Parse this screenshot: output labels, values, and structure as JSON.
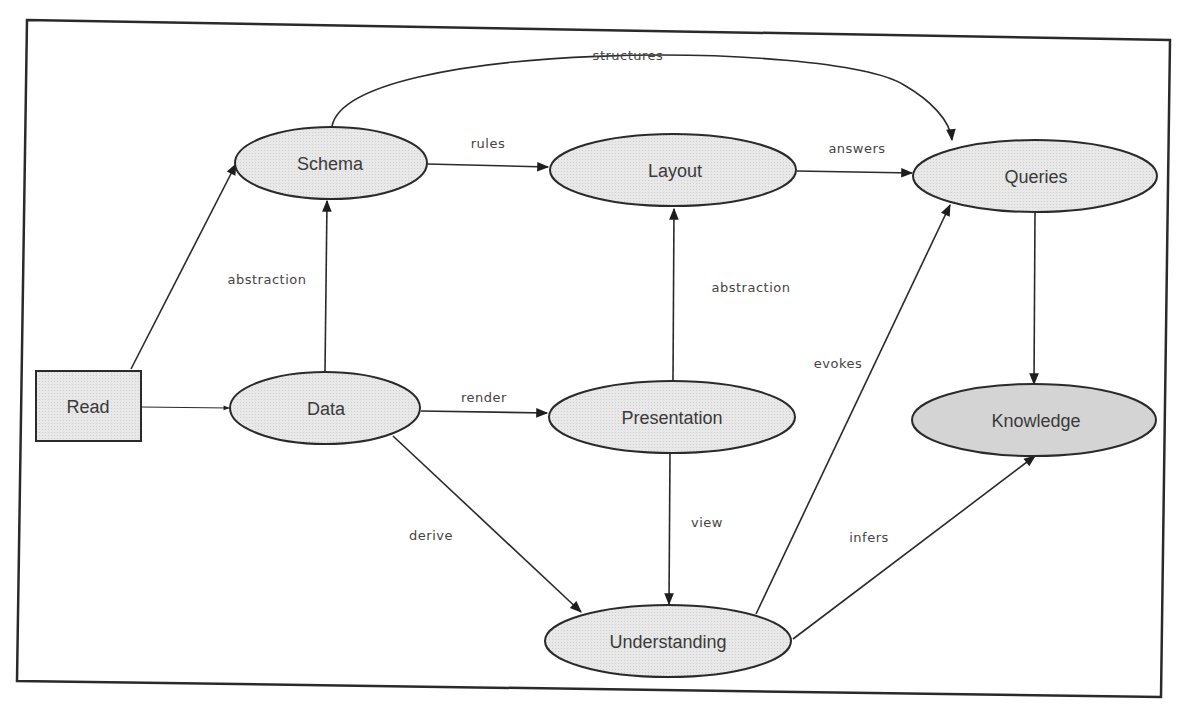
{
  "diagram": {
    "type": "flow-graph",
    "nodes": {
      "read": {
        "label": "Read",
        "shape": "rectangle"
      },
      "schema": {
        "label": "Schema",
        "shape": "ellipse"
      },
      "data": {
        "label": "Data",
        "shape": "ellipse"
      },
      "layout": {
        "label": "Layout",
        "shape": "ellipse"
      },
      "presentation": {
        "label": "Presentation",
        "shape": "ellipse"
      },
      "understanding": {
        "label": "Understanding",
        "shape": "ellipse"
      },
      "queries": {
        "label": "Queries",
        "shape": "ellipse"
      },
      "knowledge": {
        "label": "Knowledge",
        "shape": "ellipse"
      }
    },
    "edges": {
      "read_schema": {
        "from": "Read",
        "to": "Schema",
        "label": ""
      },
      "read_data": {
        "from": "Read",
        "to": "Data",
        "label": ""
      },
      "data_schema": {
        "from": "Data",
        "to": "Schema",
        "label": "abstraction"
      },
      "schema_layout": {
        "from": "Schema",
        "to": "Layout",
        "label": "rules"
      },
      "schema_queries": {
        "from": "Schema",
        "to": "Queries",
        "label": "structures"
      },
      "layout_queries": {
        "from": "Layout",
        "to": "Queries",
        "label": "answers"
      },
      "data_presentation": {
        "from": "Data",
        "to": "Presentation",
        "label": "render"
      },
      "presentation_layout": {
        "from": "Presentation",
        "to": "Layout",
        "label": "abstraction"
      },
      "data_understanding": {
        "from": "Data",
        "to": "Understanding",
        "label": "derive"
      },
      "presentation_understanding": {
        "from": "Presentation",
        "to": "Understanding",
        "label": "view"
      },
      "understanding_queries": {
        "from": "Understanding",
        "to": "Queries",
        "label": "evokes"
      },
      "understanding_knowledge": {
        "from": "Understanding",
        "to": "Knowledge",
        "label": "infers"
      },
      "queries_knowledge": {
        "from": "Queries",
        "to": "Knowledge",
        "label": ""
      }
    }
  }
}
